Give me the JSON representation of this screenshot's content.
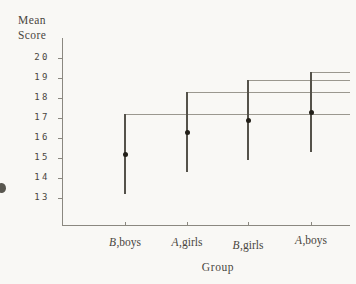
{
  "figure": {
    "y_axis_title_line1": "Mean",
    "y_axis_title_line2": "Score",
    "x_axis_title": "Group"
  },
  "chart_data": {
    "type": "scatter",
    "title": "",
    "xlabel": "Group",
    "ylabel": "Mean Score",
    "categories": [
      "B,boys",
      "A,girls",
      "B,girls",
      "A,boys"
    ],
    "series": [
      {
        "name": "mean",
        "values": [
          15.2,
          16.3,
          16.9,
          17.3
        ]
      },
      {
        "name": "interval_low",
        "values": [
          13.2,
          14.3,
          14.9,
          15.3
        ]
      },
      {
        "name": "interval_high",
        "values": [
          17.2,
          18.3,
          18.9,
          19.3
        ]
      }
    ],
    "y_ticks": [
      20,
      19,
      18,
      17,
      16,
      15,
      14,
      13
    ],
    "ylim": [
      12.3,
      21
    ],
    "grid": false,
    "legend": false,
    "annotations": "A gray horizontal reference line extends rightward from the top of each interval to the right edge of the plot"
  },
  "group_labels": [
    {
      "italic": "B",
      "rest": ",boys"
    },
    {
      "italic": "A",
      "rest": ",girls"
    },
    {
      "italic": "B",
      "rest": ",girls"
    },
    {
      "italic": "A",
      "rest": ",boys"
    }
  ],
  "colors": {
    "background": "#f9f8f5",
    "text": "#49463e",
    "axis_line": "#8b8880",
    "reference_line": "#9b988f",
    "interval_line": "#55524a",
    "point": "#232019"
  }
}
